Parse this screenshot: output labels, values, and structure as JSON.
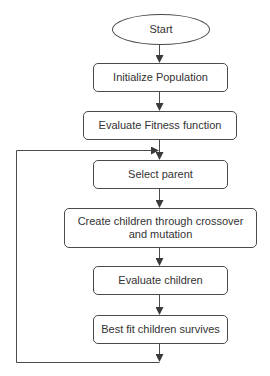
{
  "diagram": {
    "type": "flowchart",
    "title": "",
    "nodes": [
      {
        "id": "start",
        "shape": "ellipse",
        "label": "Start",
        "x": 112,
        "y": 14,
        "w": 98,
        "h": 31
      },
      {
        "id": "init",
        "shape": "rounded-rect",
        "label": "Initialize Population",
        "x": 93,
        "y": 63,
        "w": 135,
        "h": 29
      },
      {
        "id": "evalfit",
        "shape": "rounded-rect",
        "label": "Evaluate Fitness function",
        "x": 83,
        "y": 111,
        "w": 154,
        "h": 29
      },
      {
        "id": "select",
        "shape": "rounded-rect",
        "label": "Select parent",
        "x": 93,
        "y": 160,
        "w": 135,
        "h": 29
      },
      {
        "id": "create",
        "shape": "rounded-rect",
        "label": "Create children through crossover and mutation",
        "x": 64,
        "y": 208,
        "w": 193,
        "h": 40
      },
      {
        "id": "evalchild",
        "shape": "rounded-rect",
        "label": "Evaluate children",
        "x": 93,
        "y": 266,
        "w": 135,
        "h": 29
      },
      {
        "id": "best",
        "shape": "rounded-rect",
        "label": "Best fit children survives",
        "x": 93,
        "y": 315,
        "w": 135,
        "h": 29
      }
    ],
    "edges": [
      {
        "from": "start",
        "to": "init"
      },
      {
        "from": "init",
        "to": "evalfit"
      },
      {
        "from": "evalfit",
        "to": "select"
      },
      {
        "from": "select",
        "to": "create"
      },
      {
        "from": "create",
        "to": "evalchild"
      },
      {
        "from": "evalchild",
        "to": "best"
      },
      {
        "from": "best",
        "to": "select",
        "label": "",
        "routing": "loop-back-left"
      }
    ],
    "colors": {
      "stroke": "#4a4a4a",
      "fill": "#ffffff",
      "text": "#333333"
    }
  },
  "labels": {
    "start": "Start",
    "init": "Initialize Population",
    "evalfit": "Evaluate Fitness function",
    "select": "Select parent",
    "create_line1": "Create children through crossover",
    "create_line2": "and mutation",
    "evalchild": "Evaluate children",
    "best": "Best fit children survives"
  }
}
